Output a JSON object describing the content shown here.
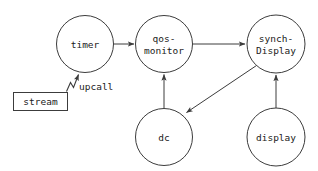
{
  "diagram": {
    "background_color": "#ffffff",
    "stroke_color": "#3c3c3c",
    "text_color": "#1a1a1a",
    "nodes": [
      {
        "id": "timer",
        "shape": "circle",
        "cx": 85,
        "cy": 44,
        "r": 28.5,
        "lines": [
          "timer"
        ]
      },
      {
        "id": "qos-monitor",
        "shape": "circle",
        "cx": 164,
        "cy": 44,
        "r": 28.5,
        "lines": [
          "qos-",
          "monitor"
        ]
      },
      {
        "id": "synch-display",
        "shape": "circle",
        "cx": 276,
        "cy": 44,
        "r": 29.0,
        "lines": [
          "synch-",
          "Display"
        ]
      },
      {
        "id": "dc",
        "shape": "circle",
        "cx": 164,
        "cy": 137,
        "r": 28.5,
        "lines": [
          "dc"
        ]
      },
      {
        "id": "display",
        "shape": "circle",
        "cx": 276,
        "cy": 137,
        "r": 29.0,
        "lines": [
          "display"
        ]
      },
      {
        "id": "stream",
        "shape": "rect",
        "x": 13,
        "y": 92,
        "w": 55,
        "h": 19,
        "lines": [
          "stream"
        ]
      }
    ],
    "labels": {
      "timer": "timer",
      "qos_monitor_line1": "qos-",
      "qos_monitor_line2": "monitor",
      "synch_display_line1": "synch-",
      "synch_display_line2": "Display",
      "dc": "dc",
      "display": "display",
      "stream": "stream",
      "upcall": "upcall"
    },
    "edges": [
      {
        "id": "timer-to-qos",
        "from": "timer",
        "to": "qos-monitor",
        "style": "straight",
        "arrow": true
      },
      {
        "id": "qos-to-synch",
        "from": "qos-monitor",
        "to": "synch-display",
        "style": "straight",
        "arrow": true
      },
      {
        "id": "dc-to-qos",
        "from": "dc",
        "to": "qos-monitor",
        "style": "straight",
        "arrow": true
      },
      {
        "id": "synch-to-dc",
        "from": "synch-display",
        "to": "dc",
        "style": "diagonal",
        "arrow": true
      },
      {
        "id": "display-to-synch",
        "from": "display",
        "to": "synch-display",
        "style": "straight",
        "arrow": true
      },
      {
        "id": "stream-to-timer-upcall",
        "from": "stream",
        "to": "timer",
        "style": "zigzag",
        "arrow": true,
        "label": "upcall"
      }
    ]
  }
}
